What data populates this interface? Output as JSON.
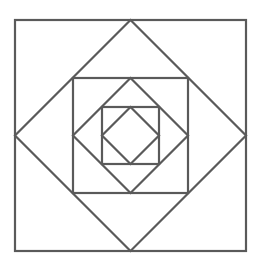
{
  "diagram": {
    "stroke_color": "#5a5a5a",
    "background": "#ffffff",
    "center": [
      130.5,
      135.5
    ],
    "shapes": [
      {
        "type": "square",
        "half": 115.5
      },
      {
        "type": "diamond",
        "half": 115.5
      },
      {
        "type": "square",
        "half": 57.5
      },
      {
        "type": "diamond",
        "half": 57.5
      },
      {
        "type": "square",
        "half": 28.5
      },
      {
        "type": "diamond",
        "half": 28.5
      }
    ]
  }
}
